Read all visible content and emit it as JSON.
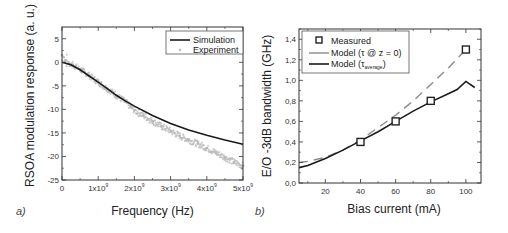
{
  "chart_data": [
    {
      "id": "a",
      "type": "line",
      "panel_label": "a)",
      "title": "",
      "xlabel": "Frequency (Hz)",
      "ylabel": "RSOA modulation response (a. u.)",
      "xlim": [
        0,
        5000000000
      ],
      "ylim": [
        -25,
        7.5
      ],
      "x_ticks": [
        {
          "value": 0,
          "label": "0",
          "sup": ""
        },
        {
          "value": 1000000000,
          "label": "1x10",
          "sup": "9"
        },
        {
          "value": 2000000000,
          "label": "2x10",
          "sup": "9"
        },
        {
          "value": 3000000000,
          "label": "3x10",
          "sup": "9"
        },
        {
          "value": 4000000000,
          "label": "4x10",
          "sup": "9"
        },
        {
          "value": 5000000000,
          "label": "5x10",
          "sup": "9"
        }
      ],
      "y_ticks": [
        {
          "value": 5,
          "label": "5"
        },
        {
          "value": 0,
          "label": "0"
        },
        {
          "value": -5,
          "label": "-5"
        },
        {
          "value": -10,
          "label": "-10"
        },
        {
          "value": -15,
          "label": "-15"
        },
        {
          "value": -20,
          "label": "-20"
        },
        {
          "value": -25,
          "label": "-25"
        }
      ],
      "grid": false,
      "legend": {
        "position": "top-right",
        "entries": [
          "Simulation",
          "Experiment"
        ]
      },
      "series": [
        {
          "name": "Simulation",
          "style": "solid-line",
          "color": "#1a1a1a",
          "x": [
            0,
            250000000,
            500000000,
            750000000,
            1000000000,
            1250000000,
            1500000000,
            1750000000,
            2000000000,
            2500000000,
            3000000000,
            3500000000,
            4000000000,
            4500000000,
            5000000000
          ],
          "y": [
            0,
            -0.5,
            -1.6,
            -2.9,
            -4.2,
            -5.6,
            -7.0,
            -8.2,
            -9.3,
            -11.3,
            -13.0,
            -14.4,
            -15.5,
            -16.5,
            -17.4
          ]
        },
        {
          "name": "Experiment",
          "style": "scatter",
          "color": "#b8b8b8",
          "x": [
            0,
            100000000,
            200000000,
            300000000,
            500000000,
            750000000,
            1000000000,
            1250000000,
            1500000000,
            1750000000,
            1900000000,
            2000000000,
            2250000000,
            2500000000,
            2750000000,
            3000000000,
            3250000000,
            3500000000,
            3750000000,
            4000000000,
            4250000000,
            4500000000,
            4750000000,
            5000000000
          ],
          "y": [
            1.5,
            0.5,
            -0.3,
            -0.5,
            -1.5,
            -2.8,
            -4.2,
            -5.6,
            -7.0,
            -8.4,
            -9.5,
            -10.2,
            -11.3,
            -12.5,
            -13.6,
            -14.6,
            -15.6,
            -16.5,
            -17.3,
            -18.2,
            -19.2,
            -20.2,
            -21.2,
            -22.0
          ]
        }
      ]
    },
    {
      "id": "b",
      "type": "line",
      "panel_label": "b)",
      "title": "",
      "xlabel": "Bias current (mA)",
      "ylabel": "E/O -3dB bandwidth (GHz)",
      "xlim": [
        5,
        108.6
      ],
      "ylim": [
        0,
        1.5
      ],
      "x_ticks": [
        {
          "value": 20,
          "label": "20"
        },
        {
          "value": 40,
          "label": "40"
        },
        {
          "value": 60,
          "label": "60"
        },
        {
          "value": 80,
          "label": "80"
        },
        {
          "value": 100,
          "label": "100"
        }
      ],
      "y_ticks": [
        {
          "value": 0.0,
          "label": "0,0"
        },
        {
          "value": 0.2,
          "label": "0,2"
        },
        {
          "value": 0.4,
          "label": "0,4"
        },
        {
          "value": 0.6,
          "label": "0,6"
        },
        {
          "value": 0.8,
          "label": "0,8"
        },
        {
          "value": 1.0,
          "label": "1,0"
        },
        {
          "value": 1.2,
          "label": "1,2"
        },
        {
          "value": 1.4,
          "label": "1,4"
        }
      ],
      "grid": false,
      "legend": {
        "position": "top-left",
        "entries": [
          "Measured",
          "Model (τ @ z = 0)",
          "Model (τ_average)"
        ]
      },
      "legend_labels": {
        "measured": "Measured",
        "model_z0": "Model (τ @ z = 0)",
        "model_avg_prefix": "Model (τ",
        "model_avg_sub": "average",
        "model_avg_suffix": ")"
      },
      "series": [
        {
          "name": "Measured",
          "style": "open-square",
          "color": "#222222",
          "x": [
            40,
            60,
            80,
            100
          ],
          "y": [
            0.4,
            0.6,
            0.8,
            1.3
          ]
        },
        {
          "name": "Model (τ @ z = 0)",
          "style": "dashed-line",
          "color": "#8c8c8c",
          "x": [
            5,
            10,
            20,
            30,
            40,
            50,
            60,
            70,
            80,
            90,
            100
          ],
          "y": [
            0.2,
            0.21,
            0.25,
            0.32,
            0.42,
            0.54,
            0.66,
            0.8,
            0.96,
            1.12,
            1.3
          ]
        },
        {
          "name": "Model (τ_average)",
          "style": "solid-line",
          "color": "#1a1a1a",
          "x": [
            5,
            10,
            20,
            30,
            40,
            50,
            60,
            70,
            80,
            90,
            95,
            100,
            105
          ],
          "y": [
            0.15,
            0.17,
            0.24,
            0.32,
            0.41,
            0.5,
            0.6,
            0.7,
            0.79,
            0.87,
            0.91,
            0.99,
            0.93
          ]
        }
      ]
    }
  ]
}
